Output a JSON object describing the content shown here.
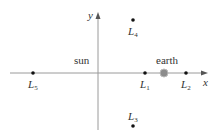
{
  "diagram": {
    "axes": {
      "x_label": "x",
      "y_label": "y",
      "origin": [
        98,
        73
      ],
      "axis_color": "#9a9a9a"
    },
    "bodies": [
      {
        "id": "sun",
        "label": "sun",
        "pos": [
          98,
          73
        ]
      },
      {
        "id": "earth",
        "label": "earth",
        "pos": [
          164,
          73
        ],
        "color": "#8c8c8c"
      }
    ],
    "points": [
      {
        "id": "L1",
        "sym": "L",
        "sub": "1",
        "pos": [
          145,
          73
        ]
      },
      {
        "id": "L2",
        "sym": "L",
        "sub": "2",
        "pos": [
          186,
          73
        ]
      },
      {
        "id": "L3",
        "sym": "L",
        "sub": "3",
        "pos": [
          133,
          126
        ]
      },
      {
        "id": "L4",
        "sym": "L",
        "sub": "4",
        "pos": [
          133,
          20
        ]
      },
      {
        "id": "L5",
        "sym": "L",
        "sub": "5",
        "pos": [
          33,
          73
        ]
      }
    ]
  }
}
